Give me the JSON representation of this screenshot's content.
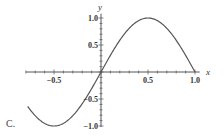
{
  "panel_label": "C.",
  "chart_data": {
    "type": "line",
    "title": "",
    "function": "y = sin(pi x)",
    "xlabel": "x",
    "ylabel": "y",
    "xlim": [
      -0.78,
      1.0
    ],
    "ylim": [
      -1.0,
      1.0
    ],
    "x_ticks": [
      -0.5,
      0.5,
      1.0
    ],
    "x_tick_labels": [
      "-0.5",
      "0.5",
      "1.0"
    ],
    "y_ticks": [
      -1.0,
      -0.5,
      0.5,
      1.0
    ],
    "y_tick_labels": [
      "-1.0",
      "-0.5",
      "0.5",
      "1.0"
    ],
    "grid": false,
    "legend": null,
    "series": [
      {
        "name": "sin(pi x)",
        "x": [
          -0.78,
          -0.75,
          -0.5,
          -0.25,
          0,
          0.25,
          0.5,
          0.75,
          1.0
        ],
        "y": [
          -0.64,
          -0.71,
          -1.0,
          -0.71,
          0,
          0.71,
          1.0,
          0.71,
          0
        ]
      }
    ],
    "line_color": "#555555"
  }
}
